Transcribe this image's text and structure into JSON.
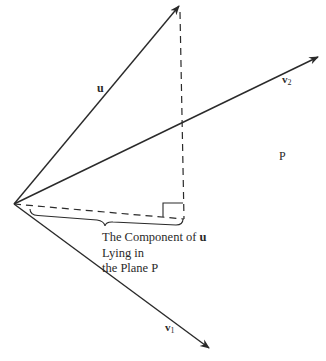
{
  "diagram": {
    "colors": {
      "background": "#ffffff",
      "stroke": "#2a2a2a"
    },
    "origin": {
      "x": 14,
      "y": 204
    },
    "vectors": [
      {
        "id": "u",
        "label": "u",
        "tip": {
          "x": 179,
          "y": 6
        },
        "label_pos": {
          "x": 97,
          "y": 92
        }
      },
      {
        "id": "v2",
        "label": "v",
        "subscript": "2",
        "tip": {
          "x": 318,
          "y": 57
        },
        "label_pos": {
          "x": 282,
          "y": 83
        }
      },
      {
        "id": "v1",
        "label": "v",
        "subscript": "1",
        "tip": {
          "x": 209,
          "y": 348
        },
        "label_pos": {
          "x": 165,
          "y": 331
        }
      }
    ],
    "projection_foot": {
      "x": 184,
      "y": 219
    },
    "plane_label": {
      "text": "P",
      "pos": {
        "x": 279,
        "y": 160
      }
    },
    "caption": {
      "lines": [
        "The Component of ",
        "Lying in",
        "the Plane P"
      ],
      "bold_symbol": "u"
    }
  }
}
